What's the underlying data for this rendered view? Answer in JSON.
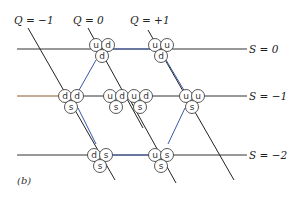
{
  "figure": {
    "caption_label": "(b)",
    "strangeness_lines": [
      {
        "label": "S = 0",
        "S": 0
      },
      {
        "label": "S = −1",
        "S": -1
      },
      {
        "label": "S = −2",
        "S": -2
      }
    ],
    "charge_lines": [
      {
        "label": "Q = −1",
        "Q": -1
      },
      {
        "label": "Q = 0",
        "Q": 0
      },
      {
        "label": "Q = +1",
        "Q": 1
      }
    ],
    "quark_states": [
      {
        "id": "udd",
        "quarks": [
          "u",
          "d",
          "d"
        ],
        "S": 0,
        "Q": 0
      },
      {
        "id": "uud",
        "quarks": [
          "u",
          "u",
          "d"
        ],
        "S": 0,
        "Q": 1
      },
      {
        "id": "dds",
        "quarks": [
          "d",
          "d",
          "s"
        ],
        "S": -1,
        "Q": -1
      },
      {
        "id": "uds-1",
        "quarks": [
          "u",
          "d",
          "s"
        ],
        "S": -1,
        "Q": 0
      },
      {
        "id": "uds-2",
        "quarks": [
          "u",
          "d",
          "s"
        ],
        "S": -1,
        "Q": 0
      },
      {
        "id": "uus",
        "quarks": [
          "u",
          "u",
          "s"
        ],
        "S": -1,
        "Q": 1
      },
      {
        "id": "dss",
        "quarks": [
          "d",
          "s",
          "s"
        ],
        "S": -2,
        "Q": -1
      },
      {
        "id": "uss",
        "quarks": [
          "u",
          "s",
          "s"
        ],
        "S": -2,
        "Q": 0
      }
    ],
    "colors": {
      "hexagon": "#3a56a8",
      "lines": "#222222",
      "s_minus1_left_segment": "#8a5a2b"
    }
  },
  "labels": {
    "q_minus1": "Q = −1",
    "q_zero": "Q = 0",
    "q_plus1": "Q = +1",
    "s_zero": "S = 0",
    "s_minus1": "S = −1",
    "s_minus2": "S = −2",
    "caption": "(b)"
  },
  "quarks": {
    "udd": {
      "a": "u",
      "b": "d",
      "c": "d"
    },
    "uud": {
      "a": "u",
      "b": "u",
      "c": "d"
    },
    "dds": {
      "a": "d",
      "b": "d",
      "c": "s"
    },
    "uds1": {
      "a": "u",
      "b": "d",
      "c": "s"
    },
    "uds2": {
      "a": "u",
      "b": "d",
      "c": "s"
    },
    "uus": {
      "a": "u",
      "b": "u",
      "c": "s"
    },
    "dss": {
      "a": "d",
      "b": "s",
      "c": "s"
    },
    "uss": {
      "a": "u",
      "b": "s",
      "c": "s"
    }
  }
}
